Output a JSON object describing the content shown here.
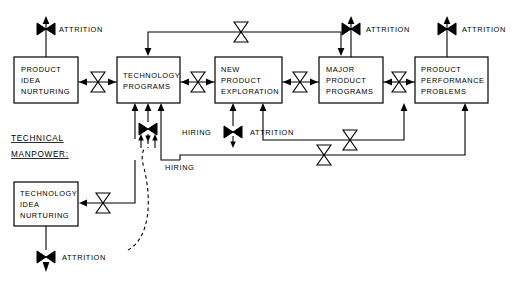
{
  "diagram": {
    "type": "system-dynamics-flow-diagram",
    "colors": {
      "stroke": "#000000",
      "background": "#ffffff",
      "box_fill": "#ffffff"
    },
    "section_label": {
      "line1": "TECHNICAL",
      "line2": "MANPOWER:"
    },
    "boxes": [
      {
        "id": "product-idea-nurturing",
        "lines": [
          "PRODUCT",
          "IDEA",
          "NURTURING"
        ],
        "x": 14,
        "y": 57,
        "w": 64,
        "h": 46
      },
      {
        "id": "technology-programs",
        "lines": [
          "TECHNOLOGY",
          "PROGRAMS"
        ],
        "x": 117,
        "y": 57,
        "w": 63,
        "h": 46
      },
      {
        "id": "new-product-exploration",
        "lines": [
          "NEW",
          "PRODUCT",
          "EXPLORATION"
        ],
        "x": 215,
        "y": 57,
        "w": 67,
        "h": 46
      },
      {
        "id": "major-product-programs",
        "lines": [
          "MAJOR",
          "PRODUCT",
          "PROGRAMS"
        ],
        "x": 319,
        "y": 57,
        "w": 64,
        "h": 46
      },
      {
        "id": "product-performance-problems",
        "lines": [
          "PRODUCT",
          "PERFORMANCE",
          "PROBLEMS"
        ],
        "x": 415,
        "y": 57,
        "w": 73,
        "h": 46
      },
      {
        "id": "technology-idea-nurturing",
        "lines": [
          "TECHNOLOGY",
          "IDEA",
          "NURTURING"
        ],
        "x": 14,
        "y": 182,
        "w": 64,
        "h": 44
      }
    ],
    "flow_labels": [
      {
        "id": "attrition-product-idea",
        "text": "ATTRITION",
        "x": 57,
        "y": 30
      },
      {
        "id": "attrition-major-product",
        "text": "ATTRITION",
        "x": 362,
        "y": 30
      },
      {
        "id": "attrition-product-performance",
        "text": "ATTRITION",
        "x": 458,
        "y": 30
      },
      {
        "id": "hiring-technology-programs",
        "text": "HIRING",
        "x": 188,
        "y": 138
      },
      {
        "id": "attrition-new-product",
        "text": "ATTRITION",
        "x": 258,
        "y": 138
      },
      {
        "id": "hiring-technology-idea",
        "text": "HIRING",
        "x": 163,
        "y": 167
      },
      {
        "id": "attrition-technology-idea",
        "text": "ATTRITION",
        "x": 58,
        "y": 257
      }
    ],
    "valves": [
      {
        "id": "valve-attrition-product-idea",
        "style": "filled-horizontal",
        "cx": 46,
        "cy": 29
      },
      {
        "id": "valve-product-idea-to-technology",
        "style": "open-vertical",
        "cx": 98,
        "cy": 82
      },
      {
        "id": "valve-top-feedback",
        "style": "open-vertical",
        "cx": 241,
        "cy": 32
      },
      {
        "id": "valve-technology-to-new-product",
        "style": "open-vertical",
        "cx": 198,
        "cy": 82
      },
      {
        "id": "valve-new-product-to-major",
        "style": "open-vertical",
        "cx": 300,
        "cy": 82
      },
      {
        "id": "valve-major-to-performance",
        "style": "open-vertical",
        "cx": 399,
        "cy": 82
      },
      {
        "id": "valve-attrition-major-product",
        "style": "filled-horizontal",
        "cx": 351,
        "cy": 29
      },
      {
        "id": "valve-attrition-product-performance",
        "style": "filled-horizontal",
        "cx": 447,
        "cy": 29
      },
      {
        "id": "valve-hiring-technology-programs",
        "style": "filled-horizontal",
        "cx": 148,
        "cy": 129
      },
      {
        "id": "valve-hiring-new-product",
        "style": "filled-horizontal",
        "cx": 233,
        "cy": 132
      },
      {
        "id": "valve-feedback-upper",
        "style": "open-vertical",
        "cx": 350,
        "cy": 130
      },
      {
        "id": "valve-feedback-lower",
        "style": "open-vertical",
        "cx": 324,
        "cy": 155
      },
      {
        "id": "valve-technology-idea-inflow",
        "style": "open-vertical",
        "cx": 103,
        "cy": 203
      },
      {
        "id": "valve-attrition-technology-idea",
        "style": "filled-horizontal",
        "cx": 46,
        "cy": 257
      }
    ]
  }
}
